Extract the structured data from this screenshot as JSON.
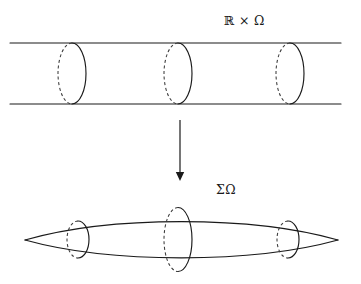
{
  "figure": {
    "background_color": "#ffffff",
    "ink_color": "#1a1a1a",
    "dash_color": "#3a3a3a",
    "width": 361,
    "height": 284
  },
  "top_label": {
    "text": "ℝ × Ω",
    "description": "real line times Omega"
  },
  "bottom_label": {
    "text": "ΣΩ",
    "description": "Sigma Omega, the suspension of Omega"
  },
  "cylinder": {
    "name": "infinite-cylinder",
    "top_line_y": 43,
    "bottom_line_y": 104,
    "x_start": 10,
    "x_end": 341,
    "cross_sections": [
      {
        "cx": 72,
        "rx": 14,
        "ry": 30.5
      },
      {
        "cx": 178,
        "rx": 14,
        "ry": 30.5
      },
      {
        "cx": 290,
        "rx": 14,
        "ry": 30.5
      }
    ]
  },
  "arrow": {
    "name": "maps-to-arrow",
    "x": 180,
    "y_start": 120,
    "y_end": 181,
    "direction": "down"
  },
  "suspension": {
    "name": "lens-suspension",
    "left_tip": {
      "x": 25,
      "y": 240
    },
    "right_tip": {
      "x": 338,
      "y": 240
    },
    "top_apex": {
      "x": 181,
      "y": 206
    },
    "bottom_apex": {
      "x": 181,
      "y": 273
    },
    "cross_sections": [
      {
        "cx": 78,
        "rx": 11,
        "ry": 18.5
      },
      {
        "cx": 178,
        "rx": 14,
        "ry": 32
      },
      {
        "cx": 288,
        "rx": 11,
        "ry": 18.5
      }
    ]
  }
}
